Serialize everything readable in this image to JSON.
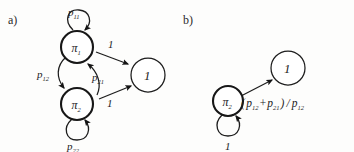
{
  "figure": {
    "width": 354,
    "height": 152,
    "background": "#fdfdfc",
    "ink": "#1d1d1d"
  },
  "panels": {
    "a": {
      "label": "a)",
      "nodes": {
        "pi1": {
          "name": "π",
          "subscript": "1"
        },
        "pi2": {
          "name": "π",
          "subscript": "2"
        },
        "one": {
          "name": "1"
        }
      },
      "edges": {
        "self_loop_top": {
          "base": "p",
          "subscript": "11"
        },
        "self_loop_bottom": {
          "base": "p",
          "subscript": "22"
        },
        "pi1_to_pi2": {
          "base": "p",
          "subscript": "12"
        },
        "pi2_to_pi1": {
          "base": "p",
          "subscript": "21"
        },
        "pi1_to_one": {
          "base": "1"
        },
        "pi2_to_one": {
          "base": "1"
        }
      }
    },
    "b": {
      "label": "b)",
      "nodes": {
        "pi2": {
          "name": "π",
          "subscript": "2"
        },
        "one": {
          "name": "1"
        }
      },
      "edges": {
        "self_loop": {
          "base": "1"
        },
        "pi2_to_one": {
          "open_paren": "(",
          "term1_base": "p",
          "term1_sub": "12",
          "plus": "+",
          "term2_base": "p",
          "term2_sub": "21",
          "close_paren": ")",
          "divide": "/",
          "denom_base": "p",
          "denom_sub": "12"
        }
      }
    }
  }
}
